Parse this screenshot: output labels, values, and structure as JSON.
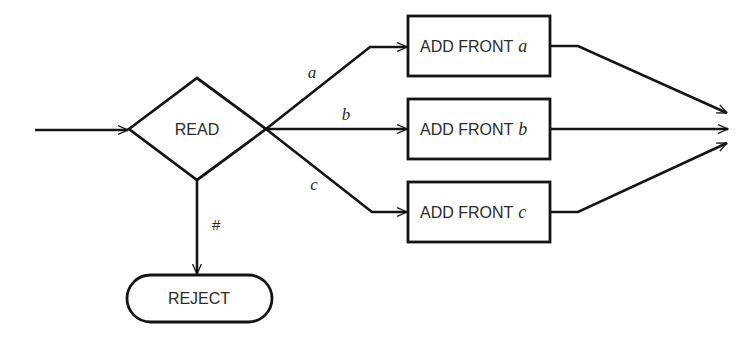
{
  "diagram": {
    "type": "flowchart",
    "colors": {
      "stroke": "#141414",
      "text": "#2a2a2a",
      "background": "#ffffff"
    },
    "decision": {
      "label": "READ"
    },
    "terminal": {
      "label": "REJECT"
    },
    "processes": [
      {
        "prefix": "ADD FRONT",
        "var": "a"
      },
      {
        "prefix": "ADD FRONT",
        "var": "b"
      },
      {
        "prefix": "ADD FRONT",
        "var": "c"
      }
    ],
    "edge_labels": {
      "a": "a",
      "b": "b",
      "c": "c",
      "reject": "#"
    }
  }
}
